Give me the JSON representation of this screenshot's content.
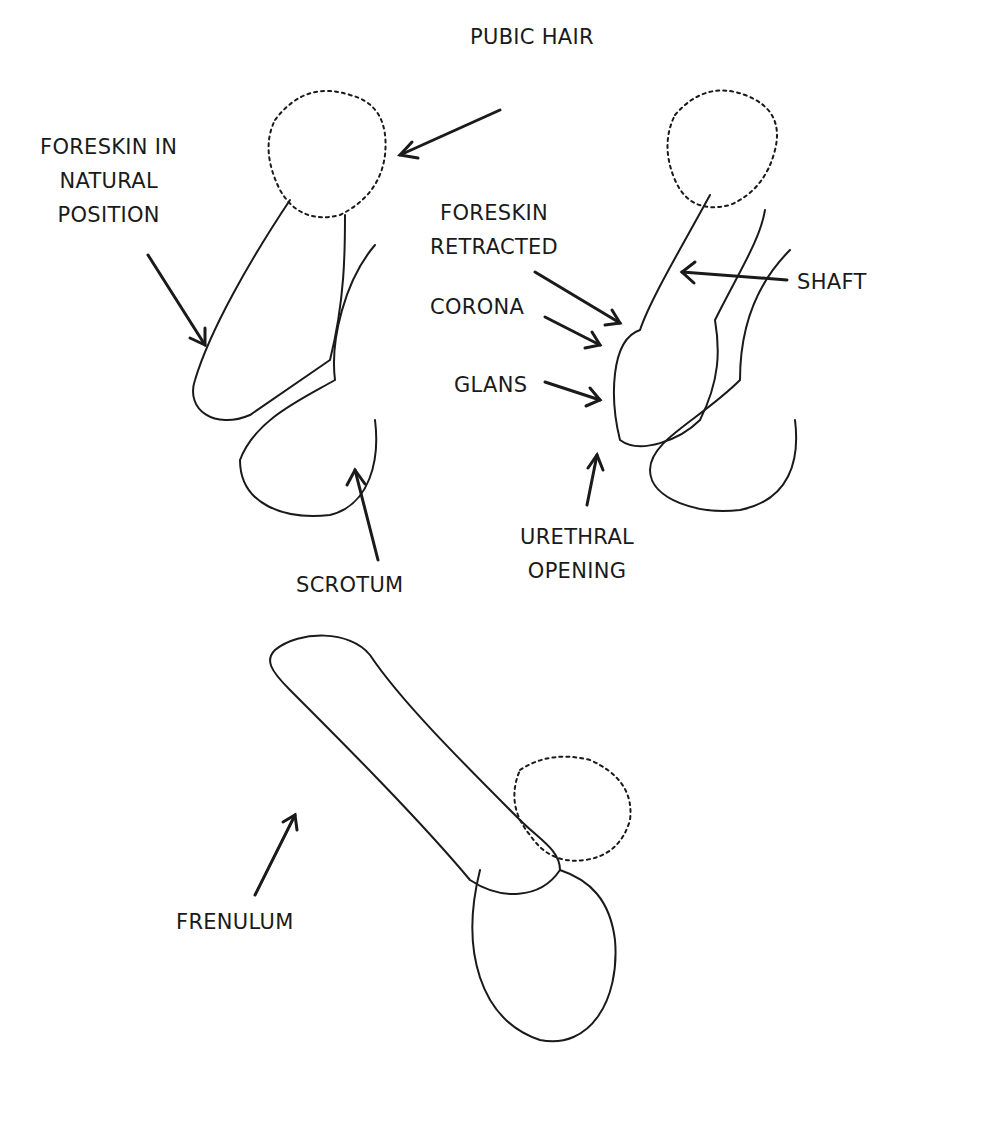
{
  "diagram": {
    "figures": [
      {
        "id": "uncircumcised-natural",
        "description": "Side view with foreskin in natural position"
      },
      {
        "id": "foreskin-retracted",
        "description": "Side view with foreskin retracted"
      },
      {
        "id": "underside-view",
        "description": "View showing underside"
      }
    ],
    "labels": {
      "pubic_hair": "PUBIC HAIR",
      "foreskin_natural": "FORESKIN IN\nNATURAL\nPOSITION",
      "scrotum": "SCROTUM",
      "foreskin_retracted": "FORESKIN\nRETRACTED",
      "shaft": "SHAFT",
      "corona": "CORONA",
      "glans": "GLANS",
      "urethral_opening": "URETHRAL\nOPENING",
      "frenulum": "FRENULUM"
    },
    "colors": {
      "line": "#1a1a1a",
      "background": "#ffffff"
    }
  }
}
